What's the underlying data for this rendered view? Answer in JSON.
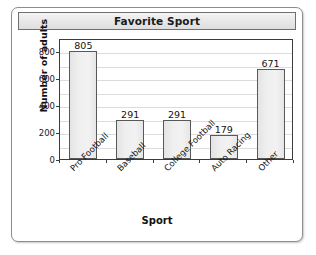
{
  "card": {
    "title": "Favorite Sport"
  },
  "chart_data": {
    "type": "bar",
    "title": "Favorite Sport",
    "xlabel": "Sport",
    "ylabel": "Number of adults",
    "categories": [
      "Pro Football",
      "Baseball",
      "College Football",
      "Auto Racing",
      "Other"
    ],
    "values": [
      805,
      291,
      291,
      179,
      671
    ],
    "value_labels": [
      "805",
      "291",
      "291",
      "179",
      "671"
    ],
    "ylim": [
      0,
      900
    ],
    "yticks": [
      0,
      200,
      400,
      600,
      800
    ],
    "ytick_labels": [
      "0",
      "200",
      "400",
      "600",
      "800"
    ],
    "gridlines": [
      100,
      200,
      300,
      400,
      500,
      600,
      700,
      800
    ],
    "grid": true,
    "legend": "none",
    "colors": {
      "bar_fill": "#eeeeee",
      "bar_stroke": "#585858",
      "axis": "#3b3b3b",
      "grid": "#dcdcdc",
      "text": "#141414",
      "card_border": "#8d8d8d",
      "title_bar": "#e9e9e9"
    }
  }
}
